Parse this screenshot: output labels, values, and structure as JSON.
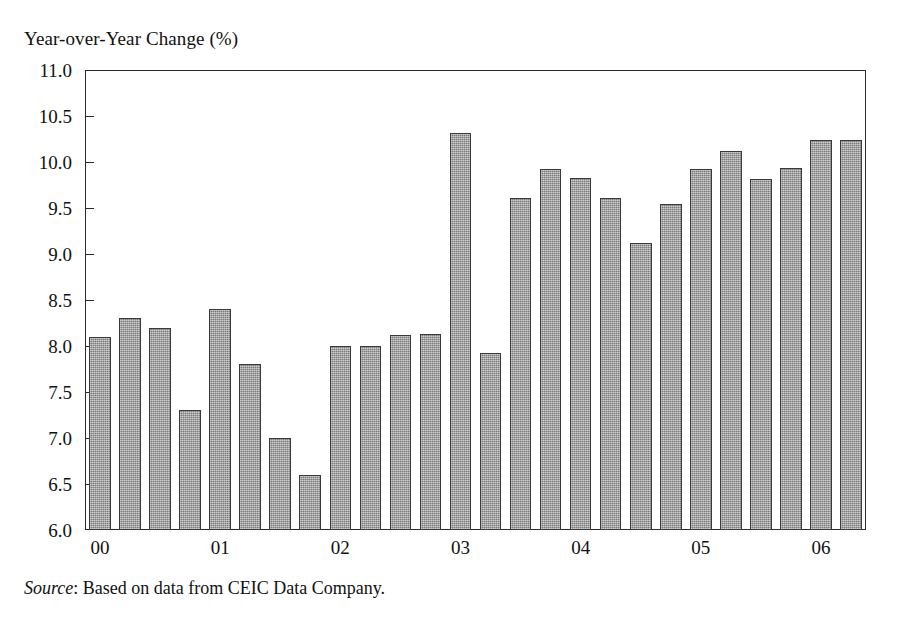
{
  "figure": {
    "axis_title": "Year-over-Year Change (%)",
    "source_prefix": "Source",
    "source_text": ": Based on data from CEIC Data Company."
  },
  "chart_data": {
    "type": "bar",
    "title": "Year-over-Year Change (%)",
    "xlabel": "",
    "ylabel": "Year-over-Year Change (%)",
    "ylim": [
      6.0,
      11.0
    ],
    "ytick_labels": [
      "11.0",
      "10.5",
      "10.0",
      "9.5",
      "9.0",
      "8.5",
      "8.0",
      "7.5",
      "7.0",
      "6.5",
      "6.0"
    ],
    "ytick_values": [
      11.0,
      10.5,
      10.0,
      9.5,
      9.0,
      8.5,
      8.0,
      7.5,
      7.0,
      6.5,
      6.0
    ],
    "xtick_labels": [
      "00",
      "01",
      "02",
      "03",
      "04",
      "05",
      "06"
    ],
    "grid": false,
    "legend": "none",
    "bar_color": "#9a9a9a",
    "bar_edge_color": "#3a3a3a",
    "categories": [
      "00Q1",
      "00Q2",
      "00Q3",
      "00Q4",
      "01Q1",
      "01Q2",
      "01Q3",
      "01Q4",
      "02Q1",
      "02Q2",
      "02Q3",
      "02Q4",
      "03Q1",
      "03Q2",
      "03Q3",
      "03Q4",
      "04Q1",
      "04Q2",
      "04Q3",
      "04Q4",
      "05Q1",
      "05Q2",
      "05Q3",
      "05Q4",
      "06Q1",
      "06Q2"
    ],
    "values": [
      8.1,
      8.3,
      8.2,
      7.3,
      8.4,
      7.8,
      7.0,
      6.6,
      8.0,
      8.0,
      8.12,
      8.13,
      10.32,
      7.92,
      9.61,
      9.92,
      9.83,
      9.61,
      9.12,
      9.54,
      9.92,
      10.12,
      9.82,
      9.93,
      10.24,
      10.24
    ],
    "bar_count": 26
  }
}
